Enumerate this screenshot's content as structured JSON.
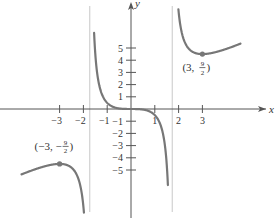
{
  "chart_data": {
    "type": "line",
    "title": "",
    "function_description": "f(x) = x^3 / (x^2 - 3)",
    "xlabel": "x",
    "ylabel": "y",
    "x_ticks": [
      -3,
      -2,
      -1,
      1,
      2,
      3
    ],
    "x_tick_labels": [
      "−3",
      "−2",
      "−1",
      "1",
      "2",
      "3"
    ],
    "y_ticks": [
      -5,
      -4,
      -3,
      -2,
      -1,
      1,
      2,
      3,
      4,
      5
    ],
    "y_tick_labels": [
      "−5",
      "−4",
      "−3",
      "−2",
      "−1",
      "1",
      "2",
      "3",
      "4",
      "5"
    ],
    "vertical_asymptotes": [
      -1.732,
      1.732
    ],
    "annotations": [
      {
        "x": 3,
        "y": 4.5,
        "label_main": "(3,",
        "label_num": "9",
        "label_den": "2",
        "label_close": ")"
      },
      {
        "x": -3,
        "y": -4.5,
        "label_main": "(−3, −",
        "label_num": "9",
        "label_den": "2",
        "label_close": ")"
      }
    ],
    "series": [
      {
        "name": "left branch",
        "x_range": [
          -4.6,
          -1.78
        ]
      },
      {
        "name": "middle branch",
        "x_range": [
          -1.55,
          1.55
        ]
      },
      {
        "name": "right branch",
        "x_range": [
          1.78,
          4.6
        ]
      }
    ],
    "grid": false,
    "legend": null,
    "curve_color": "#777777",
    "axis_color": "#555555",
    "asymptote_color": "#c8c8c8"
  }
}
